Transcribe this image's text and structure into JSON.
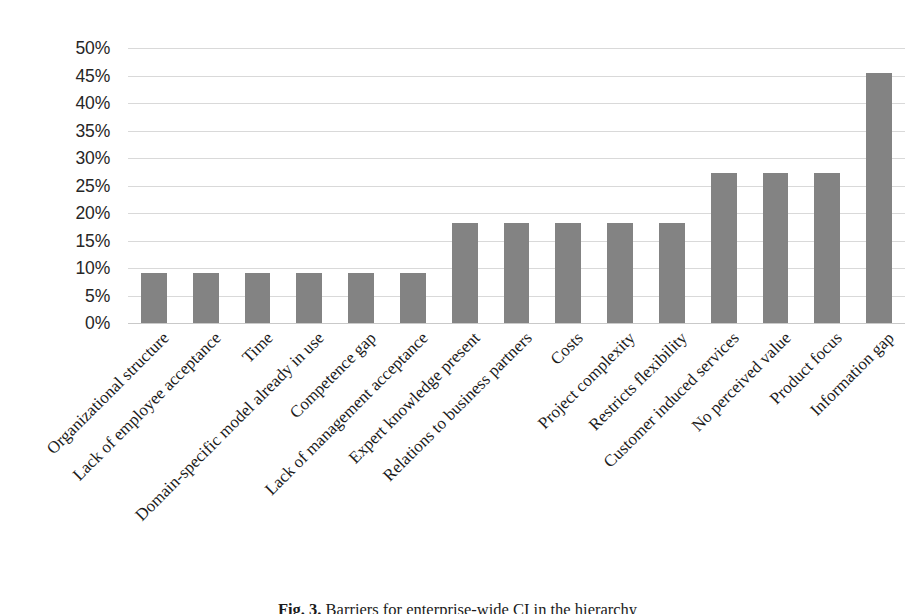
{
  "figure": {
    "caption_prefix": "Fig. 3.",
    "caption_text": "Barriers for enterprise-wide CI in the hierarchy"
  },
  "chart_data": {
    "type": "bar",
    "title": "",
    "subtitle": "",
    "xlabel": "",
    "ylabel": "",
    "ylim": [
      0,
      50
    ],
    "ytick_step": 5,
    "grid": true,
    "legend": "none",
    "unit": "%",
    "bar_color": "#838383",
    "gridline_color": "#d9d9d9",
    "categories": [
      "Organizational structure",
      "Lack of employee acceptance",
      "Time",
      "Domain-specific model already in use",
      "Competence gap",
      "Lack of management acceptance",
      "Expert knowledge present",
      "Relations to business partners",
      "Costs",
      "Project complexity",
      "Restricts flexibility",
      "Customer induced services",
      "No perceived value",
      "Product focus",
      "Information gap"
    ],
    "values": [
      9.1,
      9.1,
      9.1,
      9.1,
      9.1,
      9.1,
      18.2,
      18.2,
      18.2,
      18.2,
      18.2,
      27.3,
      27.3,
      27.3,
      45.5
    ],
    "ytick_labels": [
      "50%",
      "45%",
      "40%",
      "35%",
      "30%",
      "25%",
      "20%",
      "15%",
      "10%",
      "5%",
      "0%"
    ],
    "ytick_values": [
      50,
      45,
      40,
      35,
      30,
      25,
      20,
      15,
      10,
      5,
      0
    ]
  }
}
